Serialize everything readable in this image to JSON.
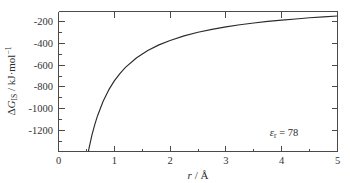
{
  "chart_data": {
    "type": "line",
    "title": "",
    "subtitle": "",
    "xlabel": "r / Å",
    "ylabel": "ΔG_IS / kJ·mol⁻¹",
    "xlabel_parts": {
      "symbol": "r",
      "separator": " / ",
      "unit": "Å"
    },
    "ylabel_parts": {
      "delta": "Δ",
      "symbol": "G",
      "subscript": "IS",
      "separator": " / ",
      "unit": "kJ·mol",
      "unit_exponent": "−1"
    },
    "xlim": [
      0,
      5
    ],
    "ylim": [
      -1300,
      -100
    ],
    "grid": false,
    "legend": null,
    "legend_position": "none",
    "x_ticks": [
      0,
      1,
      2,
      3,
      4,
      5
    ],
    "x_ticklabels": [
      "0",
      "1",
      "2",
      "3",
      "4",
      "5"
    ],
    "x_minor_ticks": [
      0.5,
      1.5,
      2.5,
      3.5,
      4.5
    ],
    "y_ticks": [
      -200,
      -400,
      -600,
      -800,
      -1000,
      -1200
    ],
    "y_ticklabels": [
      "-200",
      "-400",
      "-600",
      "-800",
      "-1000",
      "-1200"
    ],
    "y_minor_ticks": [
      -300,
      -500,
      -700,
      -900,
      -1100
    ],
    "series": [
      {
        "name": "Gibbs energy of ion solvation",
        "relation": "inverse",
        "coefficient": -695,
        "x": [
          0.5,
          0.55,
          0.6,
          0.65,
          0.7,
          0.8,
          0.9,
          1.0,
          1.1,
          1.2,
          1.4,
          1.6,
          1.8,
          2.0,
          2.25,
          2.5,
          2.75,
          3.0,
          3.25,
          3.5,
          3.75,
          4.0,
          4.25,
          4.5,
          4.75,
          5.0
        ],
        "y": [
          -1390,
          -1264,
          -1158,
          -1069,
          -993,
          -869,
          -772,
          -695,
          -632,
          -579,
          -496,
          -434,
          -386,
          -348,
          -309,
          -278,
          -253,
          -232,
          -214,
          -199,
          -185,
          -174,
          -164,
          -154,
          -146,
          -139
        ]
      }
    ],
    "annotations": [
      {
        "name": "relative-permittivity",
        "symbol": "ε",
        "subscript": "r",
        "equals": " = ",
        "value": "78",
        "text": "εr = 78",
        "x_data": 4.05,
        "y_data": -1145
      }
    ]
  },
  "axes": {
    "frame_color": "#4a4a4a",
    "curve_color": "#2b2b2b",
    "background": "#ffffff"
  }
}
